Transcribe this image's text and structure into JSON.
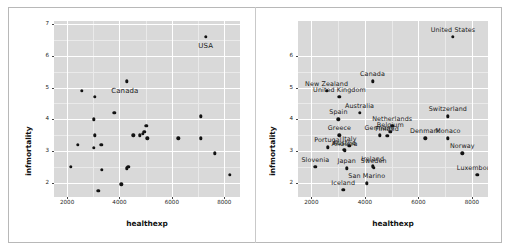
{
  "figure": {
    "background": "#ffffff",
    "panel_fill": "#d9d9d9",
    "grid_color": "#ffffff",
    "point_color": "#121212",
    "frame_color": "#b8b8b8"
  },
  "chart_data": [
    {
      "id": "left-panel",
      "type": "scatter",
      "title": "",
      "xlabel": "healthexp",
      "ylabel": "infmortality",
      "xlim": [
        1500,
        8600
      ],
      "ylim": [
        1.55,
        7.1
      ],
      "xticks": [
        2000,
        4000,
        6000,
        8000
      ],
      "yticks": [
        2,
        3,
        4,
        5,
        6,
        7
      ],
      "grid": true,
      "legend": "none",
      "annotations": [
        "USA",
        "Canada"
      ],
      "points": [
        {
          "label": "United States",
          "x": 7290,
          "y": 6.6,
          "text": "USA",
          "text_dx": 0,
          "text_dy": -0.3
        },
        {
          "label": "Canada",
          "x": 4285,
          "y": 5.2,
          "text": "Canada",
          "text_dx": -80,
          "text_dy": -0.3
        },
        {
          "label": "New Zealand",
          "x": 2570,
          "y": 4.9,
          "text": "",
          "text_dx": 0,
          "text_dy": 0
        },
        {
          "label": "United Kingdom",
          "x": 3050,
          "y": 4.7,
          "text": "",
          "text_dx": 0,
          "text_dy": 0
        },
        {
          "label": "Australia",
          "x": 3800,
          "y": 4.2,
          "text": "",
          "text_dx": 0,
          "text_dy": 0
        },
        {
          "label": "Spain",
          "x": 3010,
          "y": 4.0,
          "text": "",
          "text_dx": 0,
          "text_dy": 0
        },
        {
          "label": "Switzerland",
          "x": 7100,
          "y": 4.1,
          "text": "",
          "text_dx": 0,
          "text_dy": 0
        },
        {
          "label": "Netherlands",
          "x": 5020,
          "y": 3.8,
          "text": "",
          "text_dx": 0,
          "text_dy": 0
        },
        {
          "label": "Belgium",
          "x": 4950,
          "y": 3.6,
          "text": "",
          "text_dx": 0,
          "text_dy": 0
        },
        {
          "label": "Germany",
          "x": 4900,
          "y": 3.55,
          "text": "",
          "text_dx": 0,
          "text_dy": 0
        },
        {
          "label": "Finland",
          "x": 4780,
          "y": 3.5,
          "text": "",
          "text_dx": 0,
          "text_dy": 0
        },
        {
          "label": "Greece",
          "x": 3050,
          "y": 3.5,
          "text": "",
          "text_dx": 0,
          "text_dy": 0
        },
        {
          "label": "Denmark",
          "x": 6250,
          "y": 3.4,
          "text": "",
          "text_dx": 0,
          "text_dy": 0
        },
        {
          "label": "Monaco",
          "x": 7100,
          "y": 3.4,
          "text": "",
          "text_dx": 0,
          "text_dy": 0
        },
        {
          "label": "Ireland",
          "x": 4520,
          "y": 3.5,
          "text": "",
          "text_dx": 0,
          "text_dy": 0
        },
        {
          "label": "Austria",
          "x": 5060,
          "y": 3.4,
          "text": "",
          "text_dx": 0,
          "text_dy": 0
        },
        {
          "label": "Portugal",
          "x": 3020,
          "y": 3.1,
          "text": "",
          "text_dx": 0,
          "text_dy": 0
        },
        {
          "label": "Italy",
          "x": 3300,
          "y": 3.2,
          "text": "",
          "text_dx": 0,
          "text_dy": 0
        },
        {
          "label": "Andorra",
          "x": 2400,
          "y": 3.2,
          "text": "",
          "text_dx": 0,
          "text_dy": 0
        },
        {
          "label": "Norway",
          "x": 7640,
          "y": 2.93,
          "text": "",
          "text_dx": 0,
          "text_dy": 0
        },
        {
          "label": "Slovenia",
          "x": 2150,
          "y": 2.5,
          "text": "",
          "text_dx": 0,
          "text_dy": 0
        },
        {
          "label": "Japan",
          "x": 3320,
          "y": 2.4,
          "text": "",
          "text_dx": 0,
          "text_dy": 0
        },
        {
          "label": "Sweden",
          "x": 4330,
          "y": 2.5,
          "text": "",
          "text_dx": 0,
          "text_dy": 0
        },
        {
          "label": "Finland2",
          "x": 4290,
          "y": 2.45,
          "text": "",
          "text_dx": 0,
          "text_dy": 0
        },
        {
          "label": "Luxembourg",
          "x": 8200,
          "y": 2.25,
          "text": "",
          "text_dx": 0,
          "text_dy": 0
        },
        {
          "label": "San Marino",
          "x": 4070,
          "y": 1.95,
          "text": "",
          "text_dx": 0,
          "text_dy": 0
        },
        {
          "label": "Iceland",
          "x": 3190,
          "y": 1.75,
          "text": "",
          "text_dx": 0,
          "text_dy": 0
        }
      ]
    },
    {
      "id": "right-panel",
      "type": "scatter",
      "title": "",
      "xlabel": "healthexp",
      "ylabel": "infmortality",
      "xlim": [
        1500,
        8600
      ],
      "ylim": [
        1.55,
        7.1
      ],
      "xticks": [
        2000,
        4000,
        6000,
        8000
      ],
      "yticks": [
        2,
        3,
        4,
        5,
        6
      ],
      "grid": true,
      "legend": "none",
      "annotations": [
        "United States",
        "Canada",
        "New Zealand",
        "United Kingdom",
        "Australia",
        "Spain",
        "Switzerland",
        "Netherlands",
        "Belgium",
        "Germany",
        "Finland",
        "Greece",
        "Denmark",
        "Monaco",
        "Ireland",
        "Portugal",
        "Italy",
        "Austria",
        "Andorra",
        "Norway",
        "Slovenia",
        "Japan",
        "Sweden",
        "San Marino",
        "Iceland",
        "Luxembourg"
      ],
      "points": [
        {
          "label": "United States",
          "x": 7290,
          "y": 6.6,
          "text": "United States",
          "anchor": "center"
        },
        {
          "label": "Canada",
          "x": 4285,
          "y": 5.2,
          "text": "Canada",
          "anchor": "center"
        },
        {
          "label": "New Zealand",
          "x": 2570,
          "y": 4.9,
          "text": "New Zealand",
          "anchor": "center"
        },
        {
          "label": "United Kingdom",
          "x": 3050,
          "y": 4.7,
          "text": "United Kingdom",
          "anchor": "center"
        },
        {
          "label": "Australia",
          "x": 3800,
          "y": 4.2,
          "text": "Australia",
          "anchor": "center"
        },
        {
          "label": "Spain",
          "x": 3010,
          "y": 4.0,
          "text": "Spain",
          "anchor": "center"
        },
        {
          "label": "Switzerland",
          "x": 7100,
          "y": 4.1,
          "text": "Switzerland",
          "anchor": "center"
        },
        {
          "label": "Netherlands",
          "x": 5020,
          "y": 3.8,
          "text": "Netherlands",
          "anchor": "center"
        },
        {
          "label": "Belgium",
          "x": 4950,
          "y": 3.6,
          "text": "Belgium",
          "anchor": "center"
        },
        {
          "label": "Germany",
          "x": 4550,
          "y": 3.5,
          "text": "Germany",
          "anchor": "center"
        },
        {
          "label": "Finland",
          "x": 4830,
          "y": 3.48,
          "text": "Finland",
          "anchor": "center"
        },
        {
          "label": "Greece",
          "x": 3050,
          "y": 3.5,
          "text": "Greece",
          "anchor": "center"
        },
        {
          "label": "Denmark",
          "x": 6250,
          "y": 3.4,
          "text": "Denmark",
          "anchor": "center"
        },
        {
          "label": "Monaco",
          "x": 7100,
          "y": 3.4,
          "text": "Monaco",
          "anchor": "center"
        },
        {
          "label": "Portugal",
          "x": 2620,
          "y": 3.12,
          "text": "Portugal",
          "anchor": "center"
        },
        {
          "label": "Italy",
          "x": 3420,
          "y": 3.16,
          "text": "Italy",
          "anchor": "center"
        },
        {
          "label": "Austria",
          "x": 3230,
          "y": 3.03,
          "text": "Austria",
          "anchor": "center"
        },
        {
          "label": "Andorra",
          "x": 3240,
          "y": 3.0,
          "text": "Andorra",
          "anchor": "center"
        },
        {
          "label": "Norway",
          "x": 7640,
          "y": 2.93,
          "text": "Norway",
          "anchor": "center"
        },
        {
          "label": "Slovenia",
          "x": 2150,
          "y": 2.5,
          "text": "Slovenia",
          "anchor": "center"
        },
        {
          "label": "Japan",
          "x": 3320,
          "y": 2.45,
          "text": "Japan",
          "anchor": "center"
        },
        {
          "label": "Sweden",
          "x": 4330,
          "y": 2.47,
          "text": "Sweden",
          "anchor": "center"
        },
        {
          "label": "Ireland",
          "x": 4290,
          "y": 2.52,
          "text": "Ireland",
          "anchor": "center"
        },
        {
          "label": "Luxembourg",
          "x": 8200,
          "y": 2.25,
          "text": "Luxembourg",
          "anchor": "center"
        },
        {
          "label": "San Marino",
          "x": 4070,
          "y": 1.98,
          "text": "San Marino",
          "anchor": "center"
        },
        {
          "label": "Iceland",
          "x": 3190,
          "y": 1.78,
          "text": "Iceland",
          "anchor": "center"
        }
      ]
    }
  ]
}
